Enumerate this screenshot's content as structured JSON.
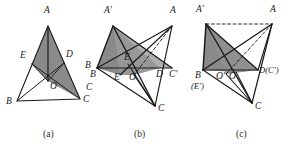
{
  "diagram": {
    "type": "geometry-diagram",
    "panel_count": 3,
    "background_color": "#ffffff",
    "stroke_color": "#1a1a1a",
    "shade_color": "#8a8a8a",
    "shade_color_light": "#b4b4b4",
    "captions": [
      {
        "text": "(a)",
        "x": 43,
        "y": 134
      },
      {
        "text": "(b)",
        "x": 134,
        "y": 134
      },
      {
        "text": "(c)",
        "x": 236,
        "y": 134
      }
    ],
    "panels": [
      {
        "id": "panel-a",
        "caption": "(a)",
        "points": {
          "A": {
            "x": 48,
            "y": 26
          },
          "B": {
            "x": 17,
            "y": 101
          },
          "C": {
            "x": 80,
            "y": 99
          },
          "D": {
            "x": 64,
            "y": 63
          },
          "E": {
            "x": 32,
            "y": 64
          },
          "O": {
            "x": 48,
            "y": 81
          }
        },
        "labels": [
          {
            "name": "A",
            "text": "A",
            "x": 44,
            "y": 10
          },
          {
            "name": "B",
            "text": "B",
            "x": 6,
            "y": 99
          },
          {
            "name": "C",
            "text": "C",
            "x": 84,
            "y": 97
          },
          {
            "name": "D",
            "text": "D",
            "x": 67,
            "y": 53
          },
          {
            "name": "E",
            "text": "E",
            "x": 21,
            "y": 54
          },
          {
            "name": "O",
            "text": "O",
            "x": 50,
            "y": 84
          },
          {
            "name": "B2",
            "text": "B",
            "x": 91,
            "y": 75
          }
        ],
        "solid_edges": [
          [
            "A",
            "B"
          ],
          [
            "A",
            "C"
          ],
          [
            "B",
            "C"
          ],
          [
            "B",
            "D"
          ],
          [
            "C",
            "E"
          ],
          [
            "A",
            "O"
          ],
          [
            "E",
            "O"
          ],
          [
            "D",
            "O"
          ],
          [
            "E",
            "D"
          ]
        ],
        "dashed_edges": [],
        "shaded_regions": [
          {
            "name": "region-A-E-O",
            "pts": [
              "A",
              "E",
              "O"
            ],
            "fill": "#8a8a8a"
          },
          {
            "name": "region-A-O-D",
            "pts": [
              "A",
              "O",
              "D"
            ],
            "fill": "#8a8a8a"
          },
          {
            "name": "region-O-D-C",
            "pts": [
              "O",
              "D",
              "C"
            ],
            "fill": "#8a8a8a"
          }
        ]
      },
      {
        "id": "panel-b",
        "caption": "(b)",
        "points": {
          "Ap": {
            "x": 113,
            "y": 26
          },
          "A": {
            "x": 172,
            "y": 26
          },
          "B": {
            "x": 97,
            "y": 68
          },
          "C": {
            "x": 155,
            "y": 106
          },
          "Cp": {
            "x": 172,
            "y": 68
          },
          "D": {
            "x": 160,
            "y": 68
          },
          "E": {
            "x": 128,
            "y": 64
          },
          "Ep": {
            "x": 120,
            "y": 75
          },
          "O": {
            "x": 134,
            "y": 75
          }
        },
        "labels": [
          {
            "name": "A-prime",
            "text": "A′",
            "x": 106,
            "y": 10
          },
          {
            "name": "A",
            "text": "A",
            "x": 172,
            "y": 10
          },
          {
            "name": "B",
            "text": "B",
            "x": 86,
            "y": 63
          },
          {
            "name": "C",
            "text": "C",
            "x": 160,
            "y": 105
          },
          {
            "name": "C-prime",
            "text": "C′",
            "x": 170,
            "y": 74
          },
          {
            "name": "D",
            "text": "D",
            "x": 157,
            "y": 74
          },
          {
            "name": "E",
            "text": "E",
            "x": 125,
            "y": 56
          },
          {
            "name": "E-prime",
            "text": "E′",
            "x": 116,
            "y": 76
          },
          {
            "name": "O",
            "text": "O",
            "x": 130,
            "y": 76
          },
          {
            "name": "C-left",
            "text": "C",
            "x": 88,
            "y": 88
          }
        ],
        "solid_edges": [
          [
            "Ap",
            "B"
          ],
          [
            "Ap",
            "Cp"
          ],
          [
            "Ap",
            "C"
          ],
          [
            "A",
            "B"
          ],
          [
            "A",
            "C"
          ],
          [
            "A",
            "Ep"
          ],
          [
            "B",
            "Cp"
          ],
          [
            "B",
            "C"
          ],
          [
            "C",
            "O"
          ],
          [
            "C",
            "E"
          ],
          [
            "Ap",
            "D"
          ]
        ],
        "dashed_edges": [
          [
            "A",
            "O"
          ]
        ],
        "shaded_regions": [
          {
            "name": "region-Ap-B-Ep-E",
            "pts": [
              "Ap",
              "B",
              "Ep",
              "E"
            ],
            "fill": "#8a8a8a"
          },
          {
            "name": "region-Ap-E-D-Cp",
            "pts": [
              "Ap",
              "E",
              "D",
              "Cp"
            ],
            "fill": "#b4b4b4"
          }
        ]
      },
      {
        "id": "panel-c",
        "caption": "(c)",
        "points": {
          "Ap": {
            "x": 206,
            "y": 24
          },
          "A": {
            "x": 272,
            "y": 24
          },
          "B": {
            "x": 203,
            "y": 70
          },
          "C": {
            "x": 252,
            "y": 103
          },
          "D": {
            "x": 258,
            "y": 70
          },
          "Op": {
            "x": 226,
            "y": 74
          },
          "O": {
            "x": 236,
            "y": 72
          }
        },
        "labels": [
          {
            "name": "A-prime",
            "text": "A′",
            "x": 198,
            "y": 8
          },
          {
            "name": "A",
            "text": "A",
            "x": 272,
            "y": 8
          },
          {
            "name": "B",
            "text": "B",
            "x": 196,
            "y": 74
          },
          {
            "name": "E-prime",
            "text": "(E′)",
            "x": 192,
            "y": 85
          },
          {
            "name": "O-prime",
            "text": "O′",
            "x": 218,
            "y": 75
          },
          {
            "name": "O",
            "text": "O",
            "x": 230,
            "y": 75
          },
          {
            "name": "D-C-prime",
            "text": "D(C′)",
            "x": 259,
            "y": 70
          },
          {
            "name": "C",
            "text": "C",
            "x": 257,
            "y": 104
          }
        ],
        "solid_edges": [
          [
            "Ap",
            "B"
          ],
          [
            "Ap",
            "D"
          ],
          [
            "Ap",
            "C"
          ],
          [
            "A",
            "B"
          ],
          [
            "A",
            "C"
          ],
          [
            "A",
            "D"
          ],
          [
            "B",
            "D"
          ],
          [
            "B",
            "C"
          ],
          [
            "C",
            "O"
          ],
          [
            "C",
            "Op"
          ]
        ],
        "dashed_edges": [
          [
            "Ap",
            "A"
          ],
          [
            "A",
            "Op"
          ]
        ],
        "shaded_regions": [
          {
            "name": "region-Ap-B-O-D",
            "pts": [
              "Ap",
              "B",
              "O",
              "D"
            ],
            "fill": "#8a8a8a"
          },
          {
            "name": "region-Ap-D-lower",
            "pts": [
              "Ap",
              "O",
              "D"
            ],
            "fill": "#8a8a8a"
          }
        ]
      }
    ]
  }
}
